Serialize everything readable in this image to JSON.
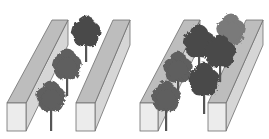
{
  "diagram": {
    "colors": {
      "wall_front": "#ececec",
      "wall_top": "#bdbdbd",
      "wall_side": "#d6d6d6",
      "wall_outline": "#6f6f6f",
      "tree_dark": "#4a4a4a",
      "tree_mid": "#5e5e5e",
      "tree_light": "#7a7a7a",
      "trunk": "#555555"
    },
    "panels": [
      {
        "name": "sparse-canopy",
        "walls": [
          {
            "front": [
              7,
              103,
              19,
              28
            ],
            "back_top_x": [
              52,
              68
            ],
            "back_top_y": 20
          },
          {
            "front": [
              76,
              103,
              19,
              28
            ],
            "back_top_x": [
              113,
              130
            ],
            "back_top_y": 20
          }
        ],
        "trees": [
          {
            "cx": 86,
            "cy": 32,
            "r": 14,
            "trunk_bottom": 62,
            "shade": "dark"
          },
          {
            "cx": 67,
            "cy": 65,
            "r": 14,
            "trunk_bottom": 96,
            "shade": "mid"
          },
          {
            "cx": 51,
            "cy": 97,
            "r": 14,
            "trunk_bottom": 131,
            "shade": "mid"
          }
        ]
      },
      {
        "name": "dense-canopy",
        "walls": [
          {
            "front": [
              140,
              103,
              18,
              28
            ],
            "back_top_x": [
              184,
              200
            ],
            "back_top_y": 20
          },
          {
            "front": [
              208,
              103,
              18,
              28
            ],
            "back_top_x": [
              246,
              263
            ],
            "back_top_y": 20
          }
        ],
        "trees": [
          {
            "cx": 231,
            "cy": 30,
            "r": 14,
            "trunk_bottom": 60,
            "shade": "light"
          },
          {
            "cx": 199,
            "cy": 42,
            "r": 15,
            "trunk_bottom": 72,
            "shade": "dark"
          },
          {
            "cx": 220,
            "cy": 52,
            "r": 15,
            "trunk_bottom": 82,
            "shade": "dark"
          },
          {
            "cx": 178,
            "cy": 68,
            "r": 14,
            "trunk_bottom": 96,
            "shade": "mid"
          },
          {
            "cx": 204,
            "cy": 80,
            "r": 15,
            "trunk_bottom": 114,
            "shade": "dark"
          },
          {
            "cx": 166,
            "cy": 97,
            "r": 14,
            "trunk_bottom": 131,
            "shade": "mid"
          }
        ]
      }
    ]
  }
}
